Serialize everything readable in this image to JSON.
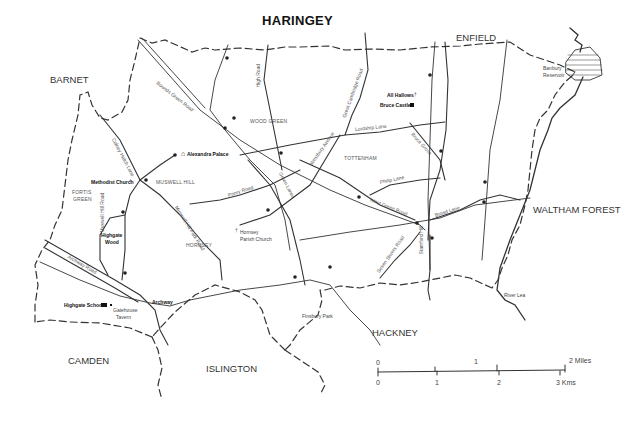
{
  "title": "HARINGEY",
  "neighbouring_boroughs": {
    "enfield": "ENFIELD",
    "barnet": "BARNET",
    "waltham_forest": "WALTHAM FOREST",
    "camden": "CAMDEN",
    "islington": "ISLINGTON",
    "hackney": "HACKNEY"
  },
  "districts": {
    "wood_green": "WOOD GREEN",
    "tottenham": "TOTTENHAM",
    "muswell_hill": "MUSWELL HILL",
    "fortis_green_1": "FORTIS",
    "fortis_green_2": "GREEN",
    "hornsey": "HORNSEY"
  },
  "roads": {
    "bounds_green": "Bounds Green Road",
    "high_road": "High Road",
    "great_cambridge": "Great Cambridge Road",
    "lordship_lane": "Lordship Lane",
    "bruce_grove": "Bruce Grove",
    "westbury_avenue": "Westbury Avenue",
    "green_lanes": "Green Lanes",
    "priory_road": "Priory Road",
    "philip_lane": "Philip Lane",
    "west_green_road": "West Green Road",
    "broad_lane": "Broad Lane",
    "seven_sisters": "Seven Sisters Road",
    "stamford_hill": "Stamford Hill",
    "colney_hatch": "Colney Hatch Lane",
    "muswell_hill_park": "Muswell Hill Park Road",
    "muswell_hill_road": "Muswell Hill Road",
    "archway_road": "Archway Road"
  },
  "places": {
    "all_hallows": "All Hallows",
    "bruce_castle": "Bruce Castle",
    "alexandra_palace": "Alexandra Palace",
    "methodist_church": "Methodist Church",
    "hornsey_parish_1": "Hornsey",
    "hornsey_parish_2": "Parish Church",
    "highgate_wood_1": "Highgate",
    "highgate_wood_2": "Wood",
    "highgate_school": "Highgate School",
    "gatehouse_1": "Gatehouse",
    "gatehouse_2": "Tavern",
    "archway": "Archway",
    "finsbury_park": "Finsbury Park",
    "banbury_1": "Banbury",
    "banbury_2": "Reservoir",
    "river_lea": "River Lea"
  },
  "scale": {
    "miles_labels": [
      "0",
      "1",
      "2 Miles"
    ],
    "km_labels": [
      "0",
      "1",
      "2",
      "3 Kms"
    ]
  },
  "colors": {
    "line": "#333333",
    "background": "#ffffff"
  }
}
